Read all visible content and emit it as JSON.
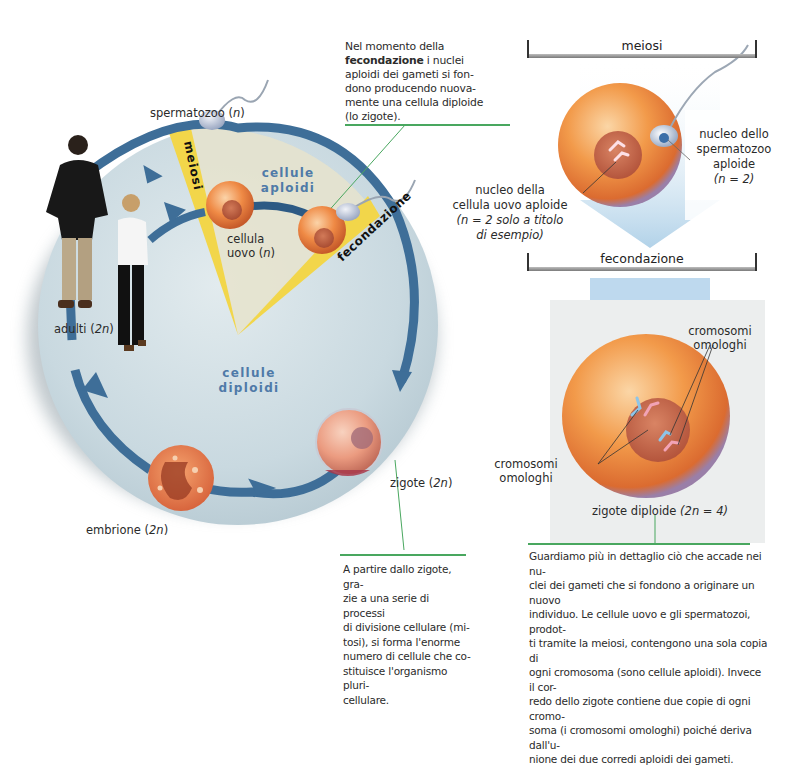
{
  "left_diagram": {
    "top_caption": {
      "before": "Nel momento della",
      "bold": "fecondazione",
      "after": " i nuclei aploidi dei gameti si fondono producendo nuovamente una cellula diploide (lo zigote).",
      "lines": [
        "Nel momento della",
        "i nuclei",
        "aploidi dei gameti si fon-",
        "dono producendo nuova-",
        "mente una cellula diploide",
        "(lo zigote)."
      ]
    },
    "labels": {
      "spermatozoo": "spermatozoo (",
      "spermatozoo_n": "n",
      "spermatozoo_close": ")",
      "meiosi": "meiosi",
      "fecondazione": "fecondazione",
      "cellule_aploidi_1": "cellule",
      "cellule_aploidi_2": "aploidi",
      "cellula_uovo_1": "cellula",
      "cellula_uovo_2": "uovo (",
      "cellula_uovo_n": "n",
      "cellula_uovo_close": ")",
      "adulti": "adulti (",
      "adulti_n": "2n",
      "adulti_close": ")",
      "cellule_diploidi": "cellule diploidi",
      "zigote": "zigote (",
      "zigote_n": "2n",
      "zigote_close": ")",
      "embrione": "embrione (",
      "embrione_n": "2n",
      "embrione_close": ")"
    },
    "bottom_caption": {
      "lines": [
        "A partire dallo zigote, gra-",
        "zie a una serie di processi",
        "di divisione cellulare (mi-",
        "tosi), si forma l'enorme",
        "numero di cellule che co-",
        "stituisce l'organismo pluri-",
        "cellulare."
      ]
    }
  },
  "right_diagram": {
    "meiosi_bracket": "meiosi",
    "fecondazione_bracket": "fecondazione",
    "nucleo_spermatozoo": [
      "nucleo dello",
      "spermatozoo",
      "aploide",
      "(n = 2)"
    ],
    "nucleo_uovo": [
      "nucleo della",
      "cellula uovo aploide",
      "(n = 2 solo a titolo",
      "di esempio)"
    ],
    "cromosomi_top": [
      "cromosomi",
      "omologhi"
    ],
    "cromosomi_left": [
      "cromosomi",
      "omologhi"
    ],
    "zigote_diploide": "zigote diploide ",
    "zigote_diploide_formula": "(2n = 4)",
    "bottom_caption": {
      "lines": [
        "Guardiamo più in dettaglio ciò che accade nei nu-",
        "clei dei gameti che si fondono a originare un nuovo",
        "individuo. Le cellule uovo e gli spermatozoi, prodot-",
        "ti tramite la meiosi, contengono una sola copia di",
        "ogni cromosoma (sono cellule aploidi). Invece il cor-",
        "redo dello zigote contiene due copie di ogni cromo-",
        "soma (i cromosomi omologhi) poiché deriva dall'u-",
        "nione dei due corredi aploidi dei gameti."
      ]
    }
  },
  "colors": {
    "cycle_arrow": "#3e6e98",
    "circle_bg": "#cfdde3",
    "yellow_band": "#f2d64a",
    "egg_orange": "#ef8a45",
    "green_rule": "#49a75f",
    "blue_label": "#4f7aa8"
  }
}
